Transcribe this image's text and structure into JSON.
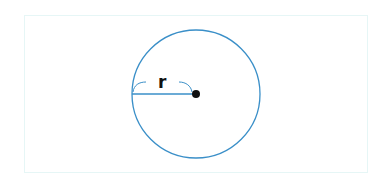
{
  "diagram": {
    "type": "circle-radius",
    "radius_label": "r",
    "colors": {
      "circle": "#3a8fc8",
      "radius_line": "#3a8fc8",
      "center_dot": "#111111",
      "frame": "#e6f6f6"
    },
    "circle": {
      "cx": 196,
      "cy": 95,
      "r": 64
    }
  }
}
